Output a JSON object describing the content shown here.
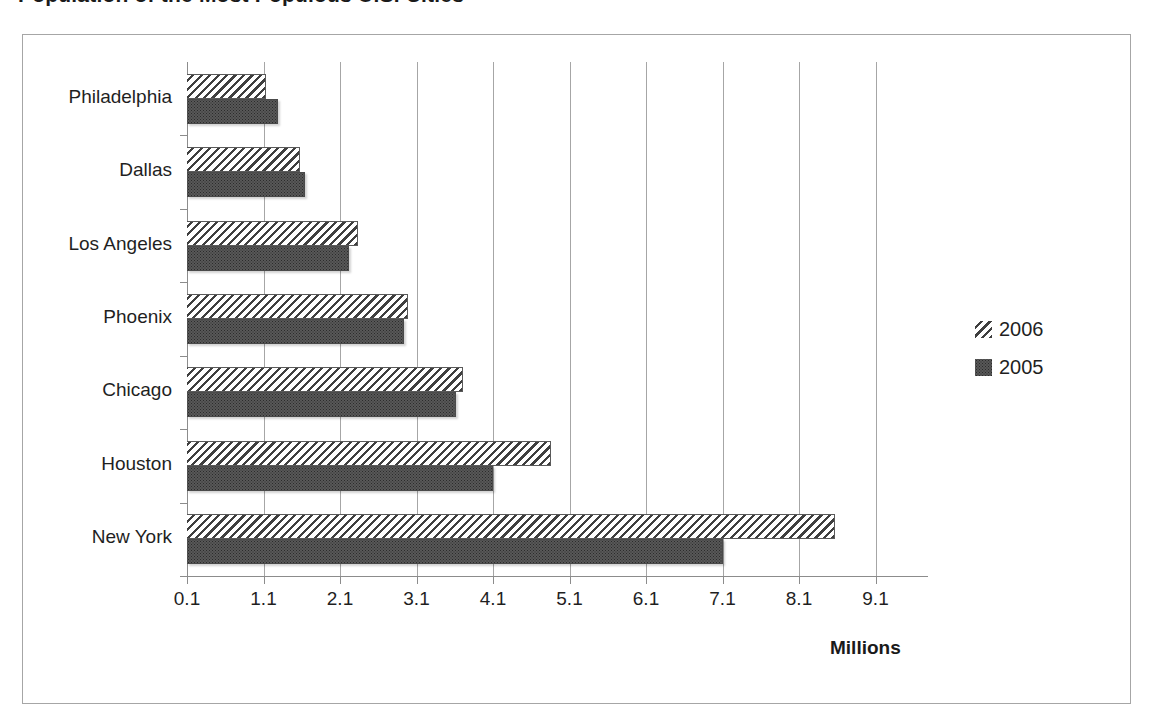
{
  "title": {
    "text": "Population of the Most Populous U.S. Cities",
    "cut_off": true
  },
  "axis": {
    "x_title": "Millions",
    "tick_labels": [
      "0.1",
      "1.1",
      "2.1",
      "3.1",
      "4.1",
      "5.1",
      "6.1",
      "7.1",
      "8.1",
      "9.1"
    ]
  },
  "legend": {
    "items": [
      {
        "label": "2006",
        "swatch": "diagonal-hatch-pattern"
      },
      {
        "label": "2005",
        "swatch": "dark-dotted-pattern"
      }
    ]
  },
  "chart_data": {
    "type": "bar",
    "orientation": "horizontal",
    "title": "Population of the Most Populous U.S. Cities",
    "xlabel": "Millions",
    "ylabel": "",
    "xlim": [
      0.1,
      9.1
    ],
    "xticks": [
      0.1,
      1.1,
      2.1,
      3.1,
      4.1,
      5.1,
      6.1,
      7.1,
      8.1,
      9.1
    ],
    "grid": "vertical",
    "legend_position": "right",
    "categories": [
      "Philadelphia",
      "Dallas",
      "Los Angeles",
      "Phoenix",
      "Chicago",
      "Houston",
      "New York"
    ],
    "series": [
      {
        "name": "2006",
        "values": [
          1.03,
          1.47,
          2.23,
          2.88,
          3.6,
          4.75,
          8.47
        ]
      },
      {
        "name": "2005",
        "values": [
          1.19,
          1.54,
          2.11,
          2.83,
          3.51,
          3.99,
          7.0
        ]
      }
    ],
    "units": "millions"
  },
  "colors": {
    "frame_border": "#a6a6a6",
    "gridline": "#a6a6a6",
    "axis": "#8c8c8c",
    "series_2006_fill": "#ffffff",
    "series_2006_hatch": "#3f3f3f",
    "series_2005_fill": "#585858",
    "text": "#1f1f1f"
  }
}
